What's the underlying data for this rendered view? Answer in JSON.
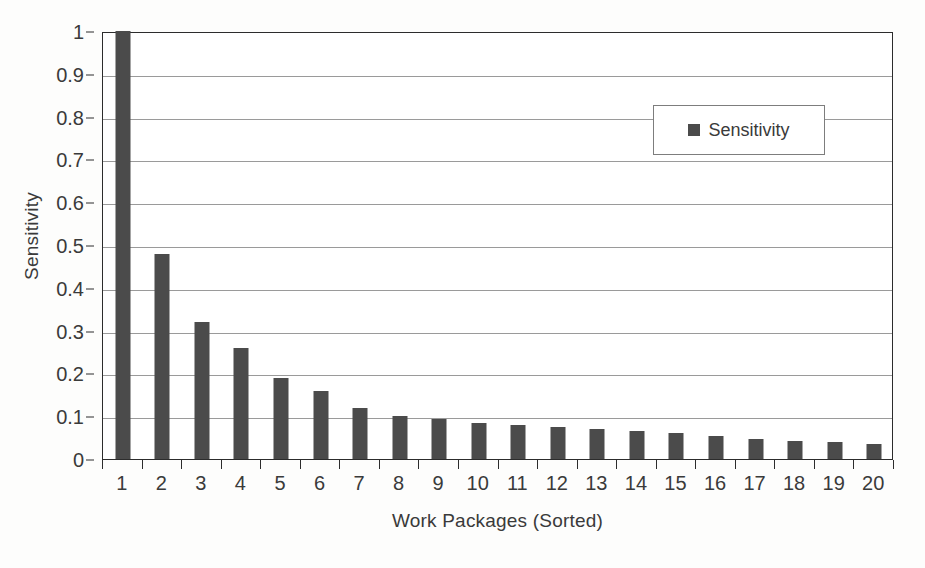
{
  "chart_data": {
    "type": "bar",
    "title": "",
    "xlabel": "Work Packages (Sorted)",
    "ylabel": "Sensitivity",
    "categories": [
      "1",
      "2",
      "3",
      "4",
      "5",
      "6",
      "7",
      "8",
      "9",
      "10",
      "11",
      "12",
      "13",
      "14",
      "15",
      "16",
      "17",
      "18",
      "19",
      "20"
    ],
    "series": [
      {
        "name": "Sensitivity",
        "color": "#4b4b4b",
        "values": [
          1.0,
          0.48,
          0.32,
          0.26,
          0.19,
          0.16,
          0.12,
          0.1,
          0.093,
          0.085,
          0.08,
          0.075,
          0.07,
          0.065,
          0.06,
          0.053,
          0.047,
          0.043,
          0.039,
          0.034
        ]
      }
    ],
    "ylim": [
      0,
      1
    ],
    "ytick_values": [
      0,
      0.1,
      0.2,
      0.3,
      0.4,
      0.5,
      0.6,
      0.7,
      0.8,
      0.9,
      1
    ],
    "ytick_labels": [
      "0",
      "0.1",
      "0.2",
      "0.3",
      "0.4",
      "0.5",
      "0.6",
      "0.7",
      "0.8",
      "0.9",
      "1"
    ],
    "grid": "horizontal",
    "legend": {
      "position": "upper-right",
      "entries": [
        {
          "label": "Sensitivity",
          "marker": "square",
          "color": "#4b4b4b"
        }
      ]
    },
    "axis_color": "#2c2c2c",
    "gridline_color": "#9a9a9a",
    "plot_background": "#ffffff",
    "figure_background": "#fdfdfc"
  }
}
